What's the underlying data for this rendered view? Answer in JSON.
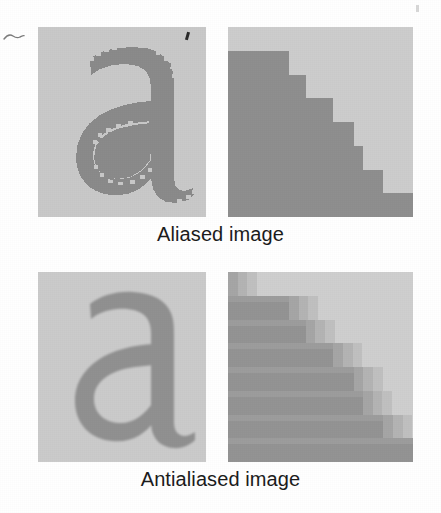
{
  "figure": {
    "background_color": "#ffffff",
    "panel_background_color": "#c9c9c9",
    "ink_color": "#8d8d8d",
    "caption_color": "#1c1c1c"
  },
  "blocks": [
    {
      "id": "aliased",
      "caption": "Aliased image",
      "letter": {
        "character": "a",
        "render_mode": "aliased",
        "panel_bg": "#c9c9c9",
        "glyph_color": "#8b8b8b"
      },
      "stairs": {
        "render_mode": "aliased",
        "panel_bg": "#cdcdcd",
        "fill_color": "#8f8f8f",
        "step_count": 8,
        "step_widths_percent": [
          0,
          33,
          42,
          57,
          68,
          73,
          84,
          100
        ],
        "edge_colors": []
      }
    },
    {
      "id": "antialiased",
      "caption": "Antialiased image",
      "letter": {
        "character": "a",
        "render_mode": "antialiased",
        "panel_bg": "#cbcbcb",
        "glyph_color": "#919191"
      },
      "stairs": {
        "render_mode": "antialiased",
        "panel_bg": "#cfcfcf",
        "fill_color": "#949494",
        "step_count": 8,
        "step_widths_percent": [
          0,
          33,
          42,
          57,
          68,
          73,
          84,
          100
        ],
        "edge_colors": [
          "#a6a6a6",
          "#b4b4b4",
          "#c0c0c0"
        ]
      }
    }
  ],
  "artifacts": {
    "squiggle_mark": "pencil-squiggle",
    "ink_speck": "ink-speck",
    "corner_fleck": "scan-fleck"
  }
}
